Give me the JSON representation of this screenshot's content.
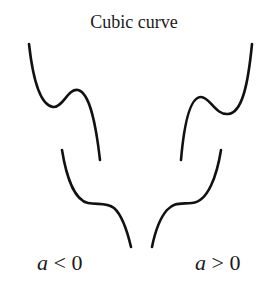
{
  "title": "Cubic curve",
  "panels": [
    {
      "name": "negative",
      "var": "a",
      "rel": " < 0"
    },
    {
      "name": "positive",
      "var": "a",
      "rel": " > 0"
    }
  ],
  "colors": {
    "curve": "#111111",
    "text": "#1a1a1a",
    "background": "#ffffff"
  }
}
